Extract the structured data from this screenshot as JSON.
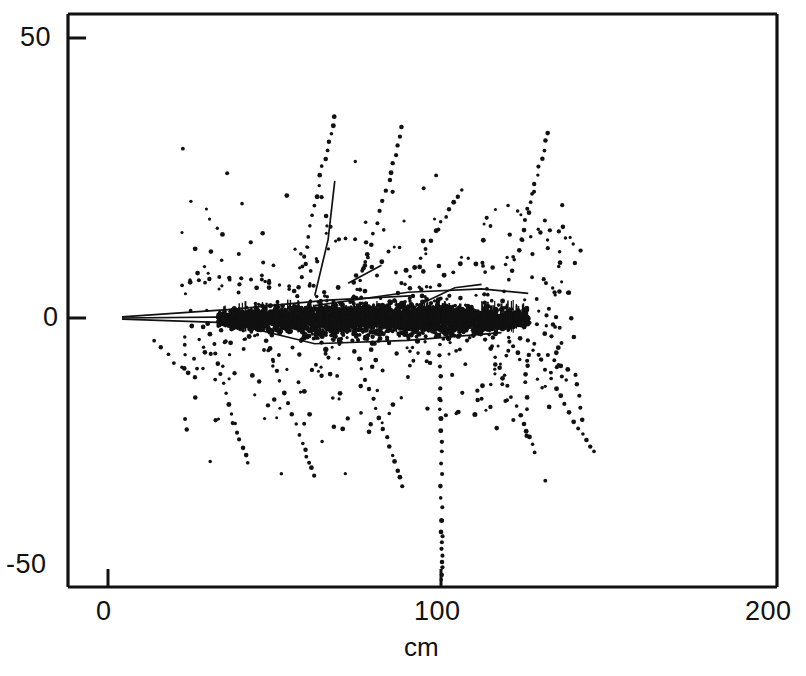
{
  "chart_data": {
    "type": "scatter",
    "title": "",
    "subtitle": "",
    "xlabel": "cm",
    "ylabel": "",
    "xlim": [
      -12,
      200
    ],
    "ylim": [
      -50,
      50
    ],
    "xticks": [
      0,
      100,
      200
    ],
    "xticklabels": [
      "0",
      "100",
      "200"
    ],
    "yticks": [
      -50,
      0,
      50
    ],
    "yticklabels": [
      "-50",
      "0",
      "50"
    ],
    "grid": false,
    "legend": null,
    "marker": "dot",
    "marker_color": "#111111",
    "background": "#ffffff",
    "frame_color": "#111111",
    "series": [
      {
        "name": "core-hits",
        "type": "dense-band",
        "note": "Saturated black hit band along beam axis",
        "x_range": [
          33,
          126
        ],
        "y_range": [
          -3.5,
          3.0
        ],
        "density": 2600
      },
      {
        "name": "scatter-hits",
        "type": "scatter",
        "note": "Diffuse isolated hits across the active region",
        "x_range": [
          22,
          140
        ],
        "y_range": [
          -32,
          38
        ],
        "count": 420
      }
    ],
    "tracks": [
      {
        "name": "solid-vertex-fan-1",
        "style": "solid",
        "points": [
          [
            4.2,
            0.2
          ],
          [
            38,
            1.6
          ],
          [
            66,
            3.2
          ],
          [
            92,
            4.0
          ]
        ]
      },
      {
        "name": "solid-vertex-fan-2",
        "style": "solid",
        "points": [
          [
            4.2,
            0.0
          ],
          [
            40,
            0.2
          ],
          [
            80,
            0.4
          ],
          [
            118,
            0.6
          ]
        ]
      },
      {
        "name": "solid-vertex-fan-3",
        "style": "solid",
        "points": [
          [
            4.2,
            -0.2
          ],
          [
            44,
            -1.0
          ],
          [
            86,
            -1.6
          ],
          [
            120,
            -1.9
          ]
        ]
      },
      {
        "name": "solid-upper-right",
        "style": "solid",
        "points": [
          [
            62,
            2.2
          ],
          [
            90,
            4.6
          ],
          [
            112,
            5.2
          ],
          [
            126,
            4.4
          ]
        ]
      },
      {
        "name": "solid-lower-sweep",
        "style": "solid",
        "points": [
          [
            40,
            -1.4
          ],
          [
            62,
            -4.6
          ],
          [
            90,
            -4.0
          ],
          [
            118,
            -2.6
          ]
        ]
      },
      {
        "name": "solid-steep-up",
        "style": "solid",
        "points": [
          [
            62,
            4.0
          ],
          [
            66,
            14.0
          ],
          [
            68,
            24.5
          ]
        ]
      },
      {
        "name": "solid-short-up-right",
        "style": "solid",
        "points": [
          [
            72,
            6.2
          ],
          [
            82,
            9.4
          ]
        ]
      },
      {
        "name": "solid-short-mid",
        "style": "solid",
        "points": [
          [
            92,
            2.0
          ],
          [
            104,
            5.4
          ],
          [
            112,
            6.0
          ]
        ]
      },
      {
        "name": "dotted-vertical-down-100",
        "style": "dotted",
        "points": [
          [
            99.5,
            -3.0
          ],
          [
            99.8,
            -20
          ],
          [
            100.0,
            -38
          ],
          [
            100.2,
            -48
          ]
        ]
      },
      {
        "name": "dotted-up-left-steep",
        "style": "dotted",
        "points": [
          [
            56,
            2.0
          ],
          [
            60,
            14
          ],
          [
            64,
            26
          ],
          [
            68,
            36
          ]
        ]
      },
      {
        "name": "dotted-up-center",
        "style": "dotted",
        "points": [
          [
            74,
            2.0
          ],
          [
            78,
            12
          ],
          [
            84,
            24
          ],
          [
            88,
            34
          ]
        ]
      },
      {
        "name": "dotted-up-right-v",
        "style": "dotted",
        "points": [
          [
            118,
            3.0
          ],
          [
            124,
            14
          ],
          [
            128,
            24
          ],
          [
            132,
            33
          ]
        ]
      },
      {
        "name": "dotted-v-branch-right",
        "style": "dotted",
        "points": [
          [
            124,
            14
          ],
          [
            134,
            16
          ],
          [
            142,
            12
          ]
        ]
      },
      {
        "name": "dotted-up-mid-arc",
        "style": "dotted",
        "points": [
          [
            84,
            1.5
          ],
          [
            92,
            9
          ],
          [
            100,
            17
          ],
          [
            106,
            23
          ]
        ]
      },
      {
        "name": "dotted-down-left",
        "style": "dotted",
        "points": [
          [
            30,
            -1.0
          ],
          [
            34,
            -10
          ],
          [
            38,
            -19
          ],
          [
            42,
            -26
          ]
        ]
      },
      {
        "name": "dotted-down-left-2",
        "style": "dotted",
        "points": [
          [
            46,
            -2.0
          ],
          [
            52,
            -12
          ],
          [
            58,
            -22
          ],
          [
            62,
            -28
          ]
        ]
      },
      {
        "name": "dotted-down-center",
        "style": "dotted",
        "points": [
          [
            72,
            -2.5
          ],
          [
            78,
            -12
          ],
          [
            84,
            -22
          ],
          [
            88,
            -30
          ]
        ]
      },
      {
        "name": "dotted-down-right",
        "style": "dotted",
        "points": [
          [
            112,
            -2.0
          ],
          [
            118,
            -10
          ],
          [
            124,
            -18
          ],
          [
            128,
            -24
          ]
        ]
      },
      {
        "name": "dotted-down-far-right",
        "style": "dotted",
        "points": [
          [
            126,
            -4.0
          ],
          [
            134,
            -12
          ],
          [
            140,
            -19
          ],
          [
            146,
            -24
          ]
        ]
      },
      {
        "name": "dotted-left-horizontal",
        "style": "dotted",
        "points": [
          [
            22,
            6.0
          ],
          [
            32,
            7.2
          ],
          [
            44,
            7.0
          ],
          [
            54,
            5.6
          ]
        ]
      },
      {
        "name": "dotted-right-horizontal",
        "style": "dotted",
        "points": [
          [
            104,
            0.5
          ],
          [
            114,
            0.0
          ],
          [
            124,
            -0.8
          ],
          [
            134,
            -1.6
          ]
        ]
      },
      {
        "name": "dotted-lower-left-tail",
        "style": "dotted",
        "points": [
          [
            14,
            -4.0
          ],
          [
            20,
            -8.0
          ],
          [
            26,
            -10.5
          ]
        ]
      },
      {
        "name": "dotted-right-kink",
        "style": "dotted",
        "points": [
          [
            120,
            -6.0
          ],
          [
            132,
            -6.8
          ],
          [
            140,
            -10
          ],
          [
            142,
            -18
          ]
        ]
      }
    ]
  },
  "axes": {
    "y_label_top": "50",
    "y_label_mid": "0",
    "y_label_bottom": "-50",
    "x_label_left": "0",
    "x_label_mid": "100",
    "x_label_right": "200",
    "x_title": "cm"
  }
}
